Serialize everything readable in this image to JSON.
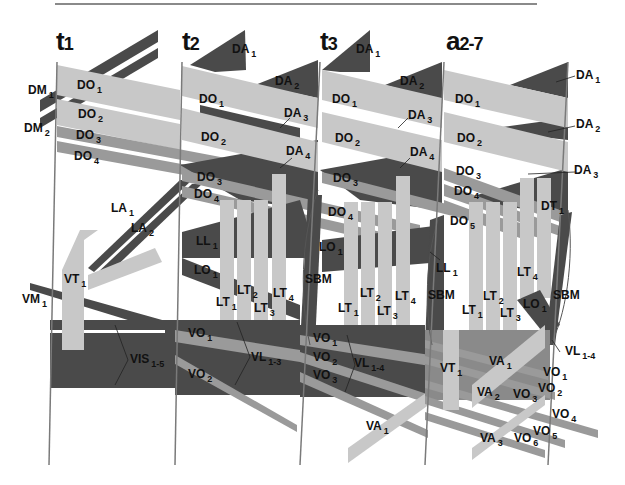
{
  "figure": {
    "colors": {
      "dark_muscle": "#4a4a4a",
      "light_muscle": "#c8c8c8",
      "mid_muscle": "#9a9a9a",
      "segment_line": "#7a7a7a",
      "background": "#ffffff"
    },
    "segments": [
      {
        "id": "t1",
        "title_main": "t",
        "title_sub": "1"
      },
      {
        "id": "t2",
        "title_main": "t",
        "title_sub": "2"
      },
      {
        "id": "t3",
        "title_main": "t",
        "title_sub": "3"
      },
      {
        "id": "a2-7",
        "title_main": "a",
        "title_sub": "2-7"
      }
    ],
    "labels": {
      "t1": {
        "DM1": {
          "base": "DM",
          "sub": "1"
        },
        "DM2": {
          "base": "DM",
          "sub": "2"
        },
        "DO1": {
          "base": "DO",
          "sub": "1"
        },
        "DO2": {
          "base": "DO",
          "sub": "2"
        },
        "DO3": {
          "base": "DO",
          "sub": "3"
        },
        "DO4": {
          "base": "DO",
          "sub": "4"
        },
        "LA1": {
          "base": "LA",
          "sub": "1"
        },
        "LA2": {
          "base": "LA",
          "sub": "2"
        },
        "VT1": {
          "base": "VT",
          "sub": "1"
        },
        "VM1": {
          "base": "VM",
          "sub": "1"
        },
        "VIS": {
          "base": "VIS",
          "sub": "1-5"
        }
      },
      "t2": {
        "DA1": {
          "base": "DA",
          "sub": "1"
        },
        "DA2": {
          "base": "DA",
          "sub": "2"
        },
        "DA3": {
          "base": "DA",
          "sub": "3"
        },
        "DA4": {
          "base": "DA",
          "sub": "4"
        },
        "DO1": {
          "base": "DO",
          "sub": "1"
        },
        "DO2": {
          "base": "DO",
          "sub": "2"
        },
        "DO3": {
          "base": "DO",
          "sub": "3"
        },
        "DO4": {
          "base": "DO",
          "sub": "4"
        },
        "LL1": {
          "base": "LL",
          "sub": "1"
        },
        "LO1": {
          "base": "LO",
          "sub": "1"
        },
        "LT1": {
          "base": "LT",
          "sub": "1"
        },
        "LT2": {
          "base": "LT",
          "sub": "2"
        },
        "LT3": {
          "base": "LT",
          "sub": "3"
        },
        "LT4": {
          "base": "LT",
          "sub": "4"
        },
        "SBM": {
          "base": "SBM",
          "sub": ""
        },
        "VO1": {
          "base": "VO",
          "sub": "1"
        },
        "VO2": {
          "base": "VO",
          "sub": "2"
        },
        "VL": {
          "base": "VL",
          "sub": "1-3"
        }
      },
      "t3": {
        "DA1": {
          "base": "DA",
          "sub": "1"
        },
        "DA2": {
          "base": "DA",
          "sub": "2"
        },
        "DA3": {
          "base": "DA",
          "sub": "3"
        },
        "DA4": {
          "base": "DA",
          "sub": "4"
        },
        "DO1": {
          "base": "DO",
          "sub": "1"
        },
        "DO2": {
          "base": "DO",
          "sub": "2"
        },
        "DO3": {
          "base": "DO",
          "sub": "3"
        },
        "DO4": {
          "base": "DO",
          "sub": "4"
        },
        "LO1": {
          "base": "LO",
          "sub": "1"
        },
        "LL1": {
          "base": "LL",
          "sub": "1"
        },
        "LT1": {
          "base": "LT",
          "sub": "1"
        },
        "LT2": {
          "base": "LT",
          "sub": "2"
        },
        "LT3": {
          "base": "LT",
          "sub": "3"
        },
        "LT4": {
          "base": "LT",
          "sub": "4"
        },
        "SBM": {
          "base": "SBM",
          "sub": ""
        },
        "VO1": {
          "base": "VO",
          "sub": "1"
        },
        "VO2": {
          "base": "VO",
          "sub": "2"
        },
        "VO3": {
          "base": "VO",
          "sub": "3"
        },
        "VL": {
          "base": "VL",
          "sub": "1-4"
        },
        "VA1": {
          "base": "VA",
          "sub": "1"
        }
      },
      "a27": {
        "DA1": {
          "base": "DA",
          "sub": "1"
        },
        "DA2": {
          "base": "DA",
          "sub": "2"
        },
        "DA3": {
          "base": "DA",
          "sub": "3"
        },
        "DO1": {
          "base": "DO",
          "sub": "1"
        },
        "DO2": {
          "base": "DO",
          "sub": "2"
        },
        "DO3": {
          "base": "DO",
          "sub": "3"
        },
        "DO4": {
          "base": "DO",
          "sub": "4"
        },
        "DO5": {
          "base": "DO",
          "sub": "5"
        },
        "DT1": {
          "base": "DT",
          "sub": "1"
        },
        "LT1": {
          "base": "LT",
          "sub": "1"
        },
        "LT2": {
          "base": "LT",
          "sub": "2"
        },
        "LT3": {
          "base": "LT",
          "sub": "3"
        },
        "LT4": {
          "base": "LT",
          "sub": "4"
        },
        "LO1": {
          "base": "LO",
          "sub": "1"
        },
        "SBM": {
          "base": "SBM",
          "sub": ""
        },
        "VT1": {
          "base": "VT",
          "sub": "1"
        },
        "VA1": {
          "base": "VA",
          "sub": "1"
        },
        "VA2": {
          "base": "VA",
          "sub": "2"
        },
        "VA3": {
          "base": "VA",
          "sub": "3"
        },
        "VO1": {
          "base": "VO",
          "sub": "1"
        },
        "VO2": {
          "base": "VO",
          "sub": "2"
        },
        "VO3": {
          "base": "VO",
          "sub": "3"
        },
        "VO4": {
          "base": "VO",
          "sub": "4"
        },
        "VO5": {
          "base": "VO",
          "sub": "5"
        },
        "VO6": {
          "base": "VO",
          "sub": "6"
        },
        "VL": {
          "base": "VL",
          "sub": "1-4"
        }
      }
    }
  }
}
